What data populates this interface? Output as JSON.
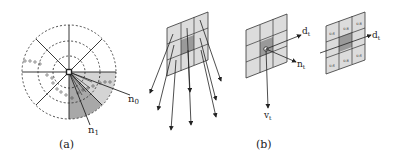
{
  "panel_a": {
    "caption": "(a)",
    "labels": {
      "n0": "n",
      "n0_sub": "0",
      "n1": "n",
      "n1_sub": "1"
    }
  },
  "panel_b": {
    "caption": "(b)",
    "labels": {
      "d": "d",
      "d_sub": "t",
      "n": "n",
      "n_sub": "t",
      "v": "v",
      "v_sub": "t",
      "d2": "d",
      "d2_sub": "t"
    },
    "cell_values": [
      "0.6",
      "0.8",
      "0.8",
      "0.6",
      "",
      "0.6",
      "0.6",
      "0.8",
      "0.6"
    ]
  },
  "colors": {
    "light_shade": "#d9d9d9",
    "mid_shade": "#b5b5b5",
    "dark_shade": "#8c8c8c",
    "line": "#222222"
  }
}
